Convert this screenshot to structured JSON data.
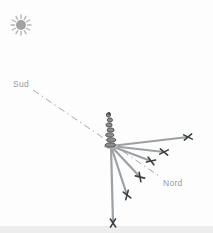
{
  "labels": {
    "south": "Sud",
    "north": "Nord"
  },
  "colors": {
    "background": "#fdfdfd",
    "ground_strip": "#ededed",
    "sun_core": "#a2a2a2",
    "sun_rays": "#b5b5b5",
    "shadow_line": "#9ba1a5",
    "x_mark": "#3c4144",
    "meridian": "#a8a8a8",
    "screw_fill": "#8d8d8d",
    "screw_stroke": "#4b4b4b",
    "screw_base": "#b4b4b4",
    "label_text": "#9b9b9b"
  },
  "diagram": {
    "canvas": {
      "width": 213,
      "height": 233
    },
    "sun": {
      "cx": 21,
      "cy": 25,
      "core_r": 5,
      "ray_inner": 6.5,
      "ray_outer": 10,
      "ray_count": 12
    },
    "gnomon": {
      "top_x": 109,
      "top_y": 115,
      "base_x": 111,
      "base_y": 145,
      "coils": 7
    },
    "meridian": {
      "x1": 33,
      "y1": 90,
      "x2": 159,
      "y2": 176
    },
    "shadow_origin": {
      "x": 111,
      "y": 146
    },
    "shadow_tips": [
      {
        "x": 188,
        "y": 137
      },
      {
        "x": 164,
        "y": 152
      },
      {
        "x": 151,
        "y": 161
      },
      {
        "x": 140,
        "y": 177
      },
      {
        "x": 127,
        "y": 195
      },
      {
        "x": 113,
        "y": 223
      }
    ],
    "ground_strip": {
      "x": 0,
      "y": 226,
      "width": 213,
      "height": 7
    },
    "south_label_pos": {
      "x": 13,
      "y": 87
    },
    "north_label_pos": {
      "x": 163,
      "y": 186
    }
  }
}
